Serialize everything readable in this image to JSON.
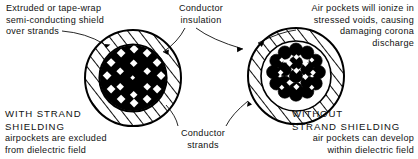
{
  "figure": {
    "ink_color": "#000000",
    "background": "#ffffff",
    "labels": {
      "shield": "Extruded or tape-wrap\nsemi-conducting shield\nover strands",
      "insulation": "Conductor\ninsulation",
      "air_pockets": "Air pockets will ionize in\nstressed voids, causing\ndamaging corona\ndischarge",
      "conductor_strands": "Conductor\nstrands",
      "with_shielding_caps": "WITH STRAND\nSHIELDING",
      "with_shielding_desc": "airpockets are excluded\nfrom dielectric field",
      "without_shielding_caps": "WITHOUT\nSTRAND SHIELDING",
      "without_shielding_desc": "air pockets can develop\nwithin dielectric field"
    },
    "cables": [
      {
        "name": "with-strand-shielding",
        "center_x": 133,
        "center_y": 78,
        "outer_radius": 48,
        "core_radius": 33,
        "strand_count": 19,
        "shielded": true
      },
      {
        "name": "without-strand-shielding",
        "center_x": 296,
        "center_y": 76,
        "outer_radius": 48,
        "core_radius": 35,
        "strand_count": 19,
        "shielded": false
      }
    ]
  }
}
